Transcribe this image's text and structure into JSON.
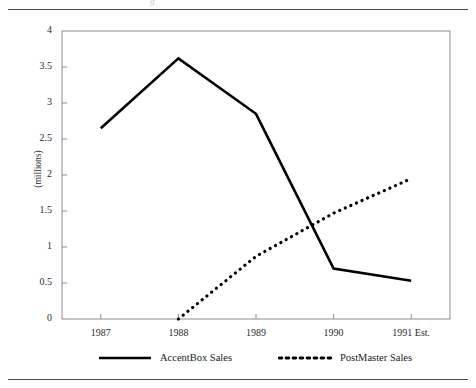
{
  "document": {
    "clipped_header_text": "g"
  },
  "chart_data": {
    "type": "line",
    "title": "",
    "xlabel": "",
    "ylabel": "(millions)",
    "categories": [
      "1987",
      "1988",
      "1989",
      "1990",
      "1991 Est."
    ],
    "ylim": [
      0,
      4
    ],
    "ytick_labels": [
      "0",
      "0.5",
      "1",
      "1.5",
      "2",
      "2.5",
      "3",
      "3.5",
      "4"
    ],
    "ytick_values": [
      0,
      0.5,
      1,
      1.5,
      2,
      2.5,
      3,
      3.5,
      4
    ],
    "grid": false,
    "legend_position": "bottom",
    "series": [
      {
        "name": "AccentBox Sales",
        "style": "solid",
        "color": "#000000",
        "values": [
          2.65,
          3.62,
          2.85,
          0.7,
          0.53
        ]
      },
      {
        "name": "PostMaster Sales",
        "style": "dotted",
        "color": "#000000",
        "values": [
          null,
          0.0,
          0.87,
          1.47,
          1.95
        ]
      }
    ]
  }
}
